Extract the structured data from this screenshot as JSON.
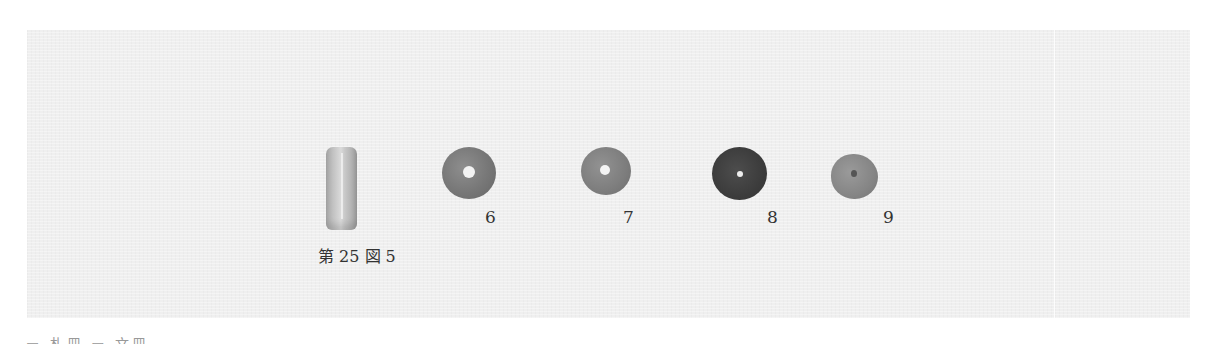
{
  "plate": {
    "background_color": "#efefef",
    "items": [
      {
        "id": "5",
        "type": "tube-bead",
        "label": "第 25 図 5"
      },
      {
        "id": "6",
        "type": "disc-bead",
        "label": "6",
        "tone": "#777777"
      },
      {
        "id": "7",
        "type": "disc-bead",
        "label": "7",
        "tone": "#7d7d7d"
      },
      {
        "id": "8",
        "type": "disc-bead",
        "label": "8",
        "tone": "#3c3c3c"
      },
      {
        "id": "9",
        "type": "disc-bead",
        "label": "9",
        "tone": "#858585"
      }
    ]
  },
  "footer": {
    "cutoff_text": "▭ 札冊 ▭ 文冊"
  }
}
